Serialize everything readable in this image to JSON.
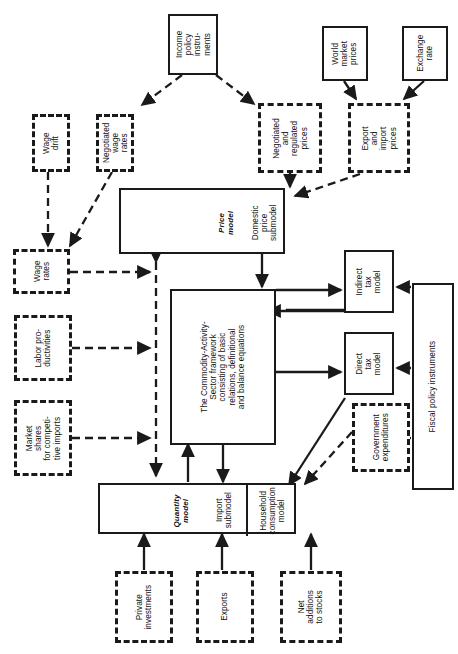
{
  "diagram": {
    "orientation": "rotated-90-ccw",
    "colors": {
      "line": "#1a1a1a",
      "background": "#ffffff"
    },
    "nodes": {
      "income_policy_instruments": "Income policy instru- ments",
      "income_policy_instruments_lines": [
        "Income",
        "policy",
        "instru-",
        "ments"
      ],
      "wage_drift_lines": [
        "Wage",
        "drift"
      ],
      "negotiated_wage_rates_lines": [
        "Negotiated",
        "wage rates"
      ],
      "wage_rates_lines": [
        "Wage",
        "rates"
      ],
      "labor_productivities_lines": [
        "Labor pro-",
        "ductivities"
      ],
      "market_shares_lines": [
        "Market shares",
        "for competi-",
        "tive imports"
      ],
      "world_market_prices_lines": [
        "World",
        "market",
        "prices"
      ],
      "exchange_rate_lines": [
        "Exchange",
        "rate"
      ],
      "negotiated_regulated_prices_lines": [
        "Negotiated",
        "and",
        "regulated",
        "prices"
      ],
      "export_import_prices_lines": [
        "Export",
        "and",
        "import",
        "prices"
      ],
      "price_model_label": "Price model",
      "price_model_label_lines": [
        "Price",
        "model"
      ],
      "domestic_price_submodel_lines": [
        "Domestic",
        "price",
        "submodel"
      ],
      "commodity_framework_lines": [
        "The Commodity-Activity-",
        "Sector framework",
        "consisting of basic",
        "relations, definitional",
        "and balance equations"
      ],
      "quantity_model_label_lines": [
        "Quantity",
        "model"
      ],
      "import_submodel_lines": [
        "Import",
        "submodel"
      ],
      "household_consumption_lines": [
        "Household",
        "consumption",
        "model"
      ],
      "indirect_tax_model_lines": [
        "Indirect",
        "tax",
        "model"
      ],
      "direct_tax_model_lines": [
        "Direct",
        "tax",
        "model"
      ],
      "fiscal_policy_instruments": "Fiscal policy instruments",
      "government_expenditures_lines": [
        "Government",
        "expenditures"
      ],
      "private_investments_lines": [
        "Private",
        "investments"
      ],
      "exports_lines": [
        "Exports"
      ],
      "net_additions_to_stocks_lines": [
        "Net",
        "additions",
        "to stocks"
      ]
    },
    "edge_list": [
      "Income policy instruments -> Negotiated wage rates",
      "Income policy instruments -> Negotiated and regulated prices",
      "Wage drift -> Wage rates",
      "Negotiated wage rates -> Wage rates",
      "Wage rates -> Price model",
      "Labor productivities -> Price model",
      "Market shares for competitive imports -> Quantity model",
      "World market prices -> Export and import prices",
      "Exchange rate -> Export and import prices",
      "Negotiated and regulated prices -> Domestic price submodel",
      "Export and import prices -> Domestic price submodel",
      "Domestic price submodel -> Commodity-Activity-Sector framework",
      "Commodity-Activity-Sector framework -> Indirect tax model",
      "Indirect tax model -> Price model",
      "Commodity-Activity-Sector framework -> Direct tax model",
      "Fiscal policy instruments -> Indirect tax model",
      "Fiscal policy instruments -> Direct tax model",
      "Fiscal policy instruments -> Government expenditures",
      "Direct tax model -> Household consumption model",
      "Government expenditures -> Household consumption model",
      "Commodity-Activity-Sector framework -> Quantity model",
      "Quantity model -> Commodity-Activity-Sector framework",
      "Private investments -> Quantity model",
      "Exports -> Import submodel",
      "Net additions to stocks -> Household consumption model"
    ]
  }
}
